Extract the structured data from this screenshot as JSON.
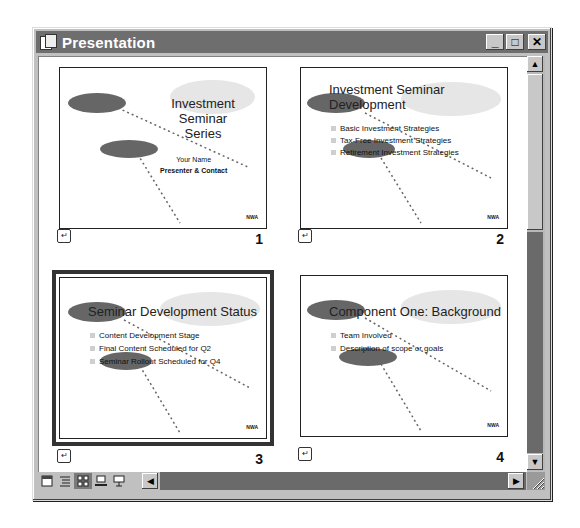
{
  "window": {
    "title": "Presentation",
    "app_icon": "powerpoint-doc-icon",
    "controls": {
      "minimize": "_",
      "maximize": "□",
      "close": "✕"
    }
  },
  "slides": [
    {
      "number": "1",
      "title": "Investment Seminar Series",
      "title_line1": "Investment Seminar",
      "title_line2": "Series",
      "subtitle_line1": "Your Name",
      "subtitle_line2": "Presenter & Contact",
      "bullets": [],
      "selected": false,
      "transition_icon": "slide-transition-icon"
    },
    {
      "number": "2",
      "title_line1": "Investment Seminar",
      "title_line2": "Development",
      "bullets": [
        "Basic Investment Strategies",
        "Tax-Free Investment Strategies",
        "Retirement Investment Strategies"
      ],
      "selected": false,
      "transition_icon": "slide-transition-icon"
    },
    {
      "number": "3",
      "title_line1": "Seminar Development Status",
      "bullets": [
        "Content Development Stage",
        "Final Content Scheduled for Q2",
        "Seminar Rollout Scheduled for Q4"
      ],
      "selected": true,
      "transition_icon": "slide-transition-icon"
    },
    {
      "number": "4",
      "title_line1": "Component One: Background",
      "bullets": [
        "Team Involved",
        "Description of scope or goals"
      ],
      "selected": false,
      "transition_icon": "slide-transition-icon"
    }
  ],
  "logo_text": "NWA",
  "view_buttons": [
    {
      "name": "normal-view",
      "active": false
    },
    {
      "name": "outline-view",
      "active": false
    },
    {
      "name": "slide-sorter-view",
      "active": true
    },
    {
      "name": "notes-page-view",
      "active": false
    },
    {
      "name": "slide-show-view",
      "active": false
    }
  ],
  "scroll": {
    "up": "▲",
    "down": "▼",
    "left": "◀",
    "right": "▶"
  }
}
